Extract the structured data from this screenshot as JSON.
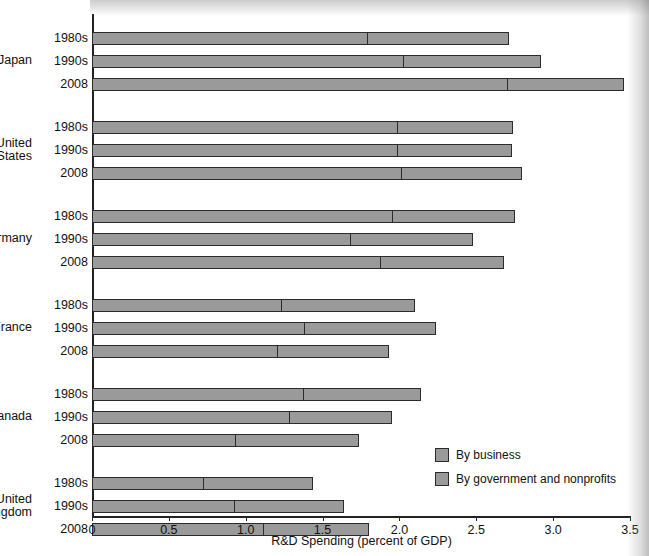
{
  "chart_data": {
    "type": "bar",
    "orientation": "horizontal",
    "stacked": true,
    "title": "",
    "xlabel": "R&D Spending (percent of GDP)",
    "ylabel": "",
    "xlim": [
      0,
      3.5
    ],
    "xticks": [
      "0",
      "0.5",
      "1.0",
      "1.5",
      "2.0",
      "2.5",
      "3.0",
      "3.5"
    ],
    "xtick_values": [
      0,
      0.5,
      1.0,
      1.5,
      2.0,
      2.5,
      3.0,
      3.5
    ],
    "grid": false,
    "legend_position": "bottom-right",
    "series": [
      {
        "name": "By business",
        "color": "#9a9a9a"
      },
      {
        "name": "By government and nonprofits",
        "color": "#9a9a9a"
      }
    ],
    "groups": [
      {
        "country": "Japan",
        "rows": [
          {
            "period": "1980s",
            "business": 1.8,
            "government": 0.91,
            "total": 2.71
          },
          {
            "period": "1990s",
            "business": 2.03,
            "government": 0.89,
            "total": 2.92
          },
          {
            "period": "2008",
            "business": 2.71,
            "government": 0.75,
            "total": 3.46
          }
        ]
      },
      {
        "country": "United States",
        "rows": [
          {
            "period": "1980s",
            "business": 1.99,
            "government": 0.75,
            "total": 2.74
          },
          {
            "period": "1990s",
            "business": 1.99,
            "government": 0.74,
            "total": 2.73
          },
          {
            "period": "2008",
            "business": 2.02,
            "government": 0.78,
            "total": 2.8
          }
        ]
      },
      {
        "country": "Germany",
        "rows": [
          {
            "period": "1980s",
            "business": 1.96,
            "government": 0.79,
            "total": 2.75
          },
          {
            "period": "1990s",
            "business": 1.69,
            "government": 0.79,
            "total": 2.48
          },
          {
            "period": "2008",
            "business": 1.88,
            "government": 0.8,
            "total": 2.68
          }
        ]
      },
      {
        "country": "France",
        "rows": [
          {
            "period": "1980s",
            "business": 1.24,
            "government": 0.86,
            "total": 2.1
          },
          {
            "period": "1990s",
            "business": 1.39,
            "government": 0.85,
            "total": 2.24
          },
          {
            "period": "2008",
            "business": 1.21,
            "government": 0.72,
            "total": 1.93
          }
        ]
      },
      {
        "country": "Canada",
        "rows": [
          {
            "period": "1980s",
            "business": 1.38,
            "government": 0.76,
            "total": 2.14
          },
          {
            "period": "1990s",
            "business": 1.29,
            "government": 0.66,
            "total": 1.95
          },
          {
            "period": "2008",
            "business": 0.94,
            "government": 0.8,
            "total": 1.74
          }
        ]
      },
      {
        "country": "United Kingdom",
        "rows": [
          {
            "period": "1980s",
            "business": 0.73,
            "government": 0.71,
            "total": 1.44
          },
          {
            "period": "1990s",
            "business": 0.93,
            "government": 0.71,
            "total": 1.64
          },
          {
            "period": "2008",
            "business": 1.12,
            "government": 0.68,
            "total": 1.8
          }
        ]
      },
      {
        "country": "Italy",
        "rows": [
          {
            "period": "1980s",
            "business": 0.65,
            "government": 0.41,
            "total": 1.06
          },
          {
            "period": "1990s",
            "business": 0.62,
            "government": 0.51,
            "total": 1.13
          },
          {
            "period": "2008",
            "business": 0.61,
            "government": 0.6,
            "total": 1.21
          }
        ]
      }
    ]
  },
  "axis": {
    "x_title": "R&D Spending (percent of GDP)"
  },
  "legend": {
    "items": [
      {
        "label": "By business"
      },
      {
        "label": "By government and nonprofits"
      }
    ]
  }
}
